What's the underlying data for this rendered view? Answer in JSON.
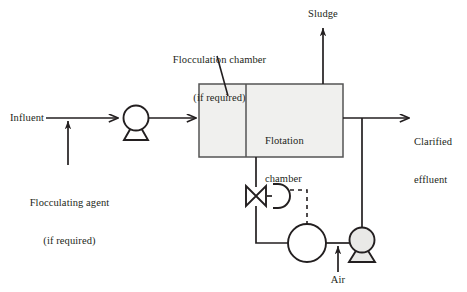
{
  "diagram": {
    "type": "process-flow-diagram",
    "background_color": "#ffffff",
    "line_color": "#231f20",
    "text_color": "#231f20",
    "vessel_fill_color": "#f0f0ee",
    "labels": {
      "influent": "Influent",
      "flocculating_agent_line1": "Flocculating agent",
      "flocculating_agent_line2": "(if required)",
      "flocculation_chamber_line1": "Flocculation chamber",
      "flocculation_chamber_line2": "(if required)",
      "flotation_chamber_line1": "Flotation",
      "flotation_chamber_line2": "chamber",
      "sludge": "Sludge",
      "clarified_effluent_line1": "Clarified",
      "clarified_effluent_line2": "effluent",
      "air": "Air"
    },
    "components": [
      {
        "name": "feed-pump",
        "kind": "centrifugal-pump",
        "cx": 136,
        "cy": 118
      },
      {
        "name": "flocculation-chamber",
        "kind": "vessel",
        "x": 199,
        "y": 84,
        "w": 47,
        "h": 73
      },
      {
        "name": "flotation-chamber",
        "kind": "vessel",
        "x": 246,
        "y": 84,
        "w": 97,
        "h": 73
      },
      {
        "name": "control-valve",
        "kind": "globe-valve",
        "cx": 256,
        "cy": 196
      },
      {
        "name": "valve-actuator",
        "kind": "diaphragm-actuator",
        "cx": 277,
        "cy": 196
      },
      {
        "name": "saturation-tank",
        "kind": "tank",
        "cx": 307,
        "cy": 243
      },
      {
        "name": "recycle-pump",
        "kind": "centrifugal-pump",
        "cx": 362,
        "cy": 240
      }
    ],
    "streams": [
      {
        "name": "influent-stream",
        "from": "influent-label",
        "to": "feed-pump"
      },
      {
        "name": "flocculating-agent-stream",
        "from": "flocculating-agent-label",
        "to": "influent-stream"
      },
      {
        "name": "pump-discharge-stream",
        "from": "feed-pump",
        "to": "flocculation-chamber"
      },
      {
        "name": "sludge-stream",
        "from": "flotation-chamber",
        "to": "sludge-label"
      },
      {
        "name": "clarified-effluent-stream",
        "from": "flotation-chamber",
        "to": "clarified-effluent-label"
      },
      {
        "name": "recycle-stream",
        "from": "clarified-effluent-stream",
        "to": "recycle-pump"
      },
      {
        "name": "air-stream",
        "from": "air-label",
        "to": "saturation-tank"
      },
      {
        "name": "pressurized-recycle-stream",
        "from": "saturation-tank",
        "to": "control-valve"
      },
      {
        "name": "valve-discharge-stream",
        "from": "control-valve",
        "to": "flotation-chamber"
      },
      {
        "name": "signal-line",
        "from": "valve-actuator",
        "to": "saturation-tank",
        "style": "dashed"
      }
    ]
  }
}
